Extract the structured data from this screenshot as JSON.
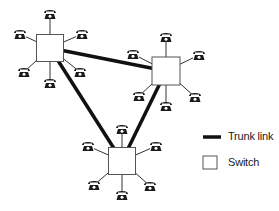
{
  "diagram": {
    "type": "network-topology",
    "colors": {
      "line": "#111111",
      "box_border": "#555555",
      "box_fill": "#ffffff",
      "phone": "#1a1a1a"
    },
    "switches": [
      {
        "id": "switch-left",
        "cx": 50,
        "cy": 48,
        "size": 27,
        "phones": [
          [
            50,
            14
          ],
          [
            20,
            34
          ],
          [
            82,
            34
          ],
          [
            24,
            72
          ],
          [
            80,
            72
          ],
          [
            50,
            83
          ]
        ]
      },
      {
        "id": "switch-right",
        "cx": 166,
        "cy": 71,
        "size": 28,
        "phones": [
          [
            166,
            37
          ],
          [
            133,
            54
          ],
          [
            199,
            55
          ],
          [
            139,
            96
          ],
          [
            166,
            106
          ],
          [
            195,
            97
          ]
        ]
      },
      {
        "id": "switch-bottom",
        "cx": 122,
        "cy": 161,
        "size": 27,
        "phones": [
          [
            122,
            129
          ],
          [
            88,
            146
          ],
          [
            156,
            146
          ],
          [
            94,
            185
          ],
          [
            122,
            195
          ],
          [
            150,
            186
          ]
        ]
      }
    ],
    "trunk_links": [
      {
        "from": "switch-left",
        "to": "switch-right"
      },
      {
        "from": "switch-left",
        "to": "switch-bottom"
      },
      {
        "from": "switch-right",
        "to": "switch-bottom"
      }
    ]
  },
  "legend": {
    "trunk_link_label": "Trunk link",
    "switch_label": "Switch"
  }
}
